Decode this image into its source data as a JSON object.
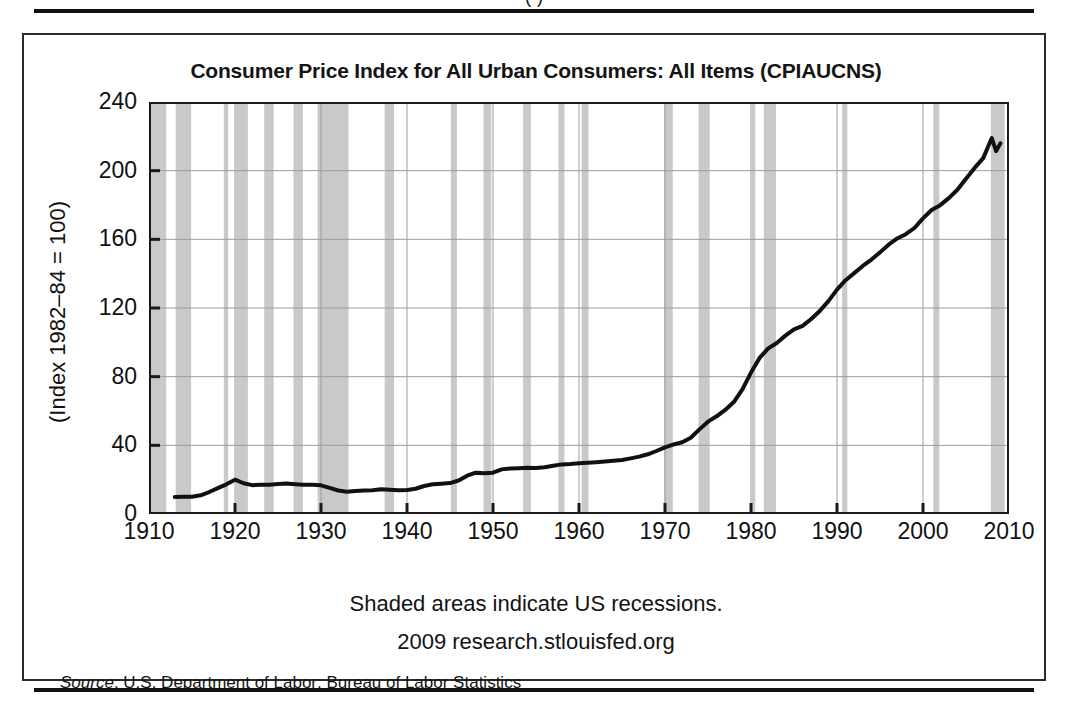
{
  "page": {
    "clipped_top_caption": "(   )",
    "source_note_label": "Source",
    "source_note_rest": ": U.S. Department of Labor: Bureau of Labor Statistics"
  },
  "chart_data": {
    "type": "line",
    "title": "Consumer Price Index for All Urban Consumers: All Items (CPIAUCNS)",
    "xlabel": "",
    "ylabel": "(Index 1982–84 = 100)",
    "xlim": [
      1910,
      2010
    ],
    "ylim": [
      0,
      240
    ],
    "grid": true,
    "legend_position": "none",
    "x_ticks": [
      1910,
      1920,
      1930,
      1940,
      1950,
      1960,
      1970,
      1980,
      1990,
      2000,
      2010
    ],
    "x_tick_labels": [
      "1910",
      "1920",
      "1930",
      "1940",
      "1950",
      "1960",
      "1970",
      "1980",
      "1990",
      "2000",
      "2010"
    ],
    "y_ticks": [
      0,
      40,
      80,
      120,
      160,
      200,
      240
    ],
    "y_tick_labels": [
      "0",
      "40",
      "80",
      "120",
      "160",
      "200",
      "240"
    ],
    "line_color": "#111111",
    "line_width": 4,
    "shade_color": "#c9c9c9",
    "annotations": [
      "Shaded areas indicate US recessions.",
      "2009 research.stlouisfed.org"
    ],
    "series": [
      {
        "name": "CPIAUCNS",
        "x": [
          1913,
          1914,
          1915,
          1916,
          1917,
          1918,
          1919,
          1920,
          1921,
          1922,
          1923,
          1924,
          1925,
          1926,
          1927,
          1928,
          1929,
          1930,
          1931,
          1932,
          1933,
          1934,
          1935,
          1936,
          1937,
          1938,
          1939,
          1940,
          1941,
          1942,
          1943,
          1944,
          1945,
          1946,
          1947,
          1948,
          1949,
          1950,
          1951,
          1952,
          1953,
          1954,
          1955,
          1956,
          1957,
          1958,
          1959,
          1960,
          1961,
          1962,
          1963,
          1964,
          1965,
          1966,
          1967,
          1968,
          1969,
          1970,
          1971,
          1972,
          1973,
          1974,
          1975,
          1976,
          1977,
          1978,
          1979,
          1980,
          1981,
          1982,
          1983,
          1984,
          1985,
          1986,
          1987,
          1988,
          1989,
          1990,
          1991,
          1992,
          1993,
          1994,
          1995,
          1996,
          1997,
          1998,
          1999,
          2000,
          2001,
          2002,
          2003,
          2004,
          2005,
          2006,
          2007,
          2008,
          2008.5,
          2009
        ],
        "values": [
          9.9,
          10.0,
          10.1,
          10.9,
          12.8,
          15.1,
          17.3,
          20.0,
          17.9,
          16.8,
          17.1,
          17.1,
          17.5,
          17.7,
          17.4,
          17.1,
          17.1,
          16.7,
          15.2,
          13.7,
          13.0,
          13.4,
          13.7,
          13.9,
          14.4,
          14.1,
          13.9,
          14.0,
          14.7,
          16.3,
          17.3,
          17.6,
          18.0,
          19.5,
          22.3,
          24.1,
          23.8,
          24.1,
          26.0,
          26.5,
          26.7,
          26.9,
          26.8,
          27.2,
          28.1,
          28.9,
          29.1,
          29.6,
          29.9,
          30.2,
          30.6,
          31.0,
          31.5,
          32.4,
          33.4,
          34.8,
          36.7,
          38.8,
          40.5,
          41.8,
          44.4,
          49.3,
          53.8,
          56.9,
          60.6,
          65.2,
          72.6,
          82.4,
          90.9,
          96.5,
          99.6,
          103.9,
          107.6,
          109.6,
          113.6,
          118.3,
          124.0,
          130.7,
          136.2,
          140.3,
          144.5,
          148.2,
          152.4,
          156.9,
          160.5,
          163.0,
          166.6,
          172.2,
          177.1,
          179.9,
          184.0,
          188.9,
          195.3,
          201.6,
          207.3,
          219.0,
          211.4,
          215.9
        ]
      }
    ],
    "recession_bands": [
      {
        "start": 1910.0,
        "end": 1912.0
      },
      {
        "start": 1913.1,
        "end": 1914.9
      },
      {
        "start": 1918.7,
        "end": 1919.2
      },
      {
        "start": 1920.1,
        "end": 1921.5
      },
      {
        "start": 1923.4,
        "end": 1924.5
      },
      {
        "start": 1926.8,
        "end": 1927.9
      },
      {
        "start": 1929.6,
        "end": 1933.2
      },
      {
        "start": 1937.4,
        "end": 1938.5
      },
      {
        "start": 1945.1,
        "end": 1945.8
      },
      {
        "start": 1948.9,
        "end": 1949.8
      },
      {
        "start": 1953.5,
        "end": 1954.4
      },
      {
        "start": 1957.6,
        "end": 1958.3
      },
      {
        "start": 1960.3,
        "end": 1961.1
      },
      {
        "start": 1969.9,
        "end": 1970.9
      },
      {
        "start": 1973.9,
        "end": 1975.2
      },
      {
        "start": 1980.1,
        "end": 1980.5
      },
      {
        "start": 1981.5,
        "end": 1982.9
      },
      {
        "start": 1990.6,
        "end": 1991.2
      },
      {
        "start": 2001.2,
        "end": 2001.9
      },
      {
        "start": 2007.9,
        "end": 2009.5
      }
    ]
  }
}
